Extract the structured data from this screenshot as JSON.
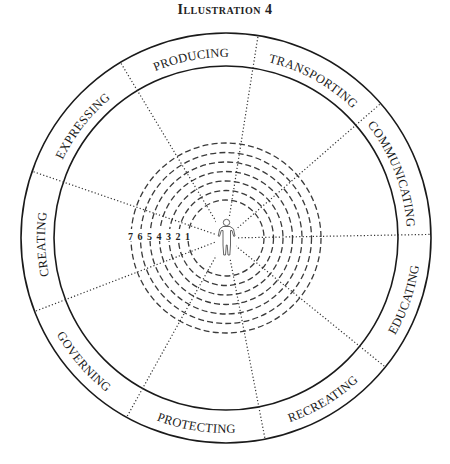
{
  "title": "Illustration 4",
  "diagram": {
    "type": "concentric-wheel",
    "center_figure": "person-icon",
    "sectors": [
      {
        "label": "PRODUCING"
      },
      {
        "label": "TRANSPORTING"
      },
      {
        "label": "COMMUNICATING"
      },
      {
        "label": "EDUCATING"
      },
      {
        "label": "RECREATING"
      },
      {
        "label": "PROTECTING"
      },
      {
        "label": "GOVERNING"
      },
      {
        "label": "CREATING"
      },
      {
        "label": "EXPRESSING"
      }
    ],
    "levels": [
      "7",
      "6",
      "5",
      "4",
      "3",
      "2",
      "1"
    ],
    "colors": {
      "ink": "#1a1a1a",
      "background": "#ffffff"
    }
  }
}
